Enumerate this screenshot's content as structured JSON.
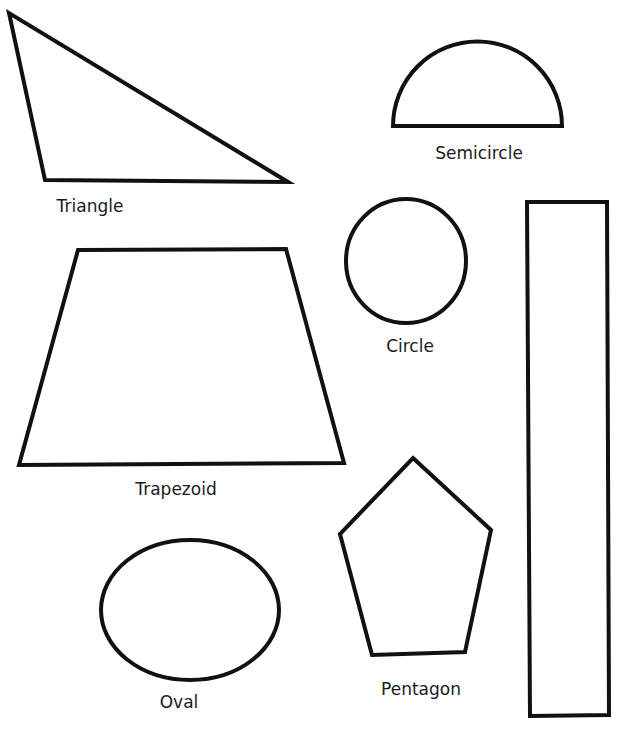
{
  "worksheet": {
    "title": "",
    "stroke_color": "#111111",
    "background_color": "#ffffff",
    "shapes": [
      {
        "id": "triangle",
        "label": "Triangle"
      },
      {
        "id": "semicircle",
        "label": "Semicircle"
      },
      {
        "id": "circle",
        "label": "Circle"
      },
      {
        "id": "rectangle",
        "label": ""
      },
      {
        "id": "trapezoid",
        "label": "Trapezoid"
      },
      {
        "id": "pentagon",
        "label": "Pentagon"
      },
      {
        "id": "oval",
        "label": "Oval"
      }
    ]
  }
}
